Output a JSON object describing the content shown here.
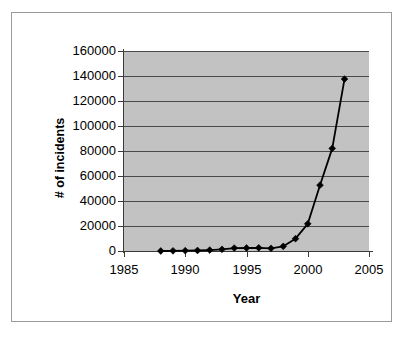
{
  "chart_data": {
    "type": "line",
    "title": "",
    "xlabel": "Year",
    "ylabel": "# of incidents",
    "xlim": [
      1985,
      2005
    ],
    "ylim": [
      0,
      160000
    ],
    "x_ticks": [
      1985,
      1990,
      1995,
      2000,
      2005
    ],
    "y_ticks": [
      0,
      20000,
      40000,
      60000,
      80000,
      100000,
      120000,
      140000,
      160000
    ],
    "x_tick_labels": [
      "1985",
      "1990",
      "1995",
      "2000",
      "2005"
    ],
    "y_tick_labels": [
      "0",
      "20000",
      "40000",
      "60000",
      "80000",
      "100000",
      "120000",
      "140000",
      "160000"
    ],
    "grid": "horizontal",
    "legend": "none",
    "marker": "diamond",
    "line_color": "#000000",
    "marker_color": "#000000",
    "plot_background": "#c2c2c2",
    "chart_background": "#ffffff",
    "x": [
      1988,
      1989,
      1990,
      1991,
      1992,
      1993,
      1994,
      1995,
      1996,
      1997,
      1998,
      1999,
      2000,
      2001,
      2002,
      2003
    ],
    "values": [
      6,
      132,
      252,
      406,
      773,
      1334,
      2340,
      2412,
      2573,
      2134,
      3734,
      9859,
      21756,
      52658,
      82094,
      137529
    ],
    "series": [
      {
        "name": "# of incidents",
        "values": [
          6,
          132,
          252,
          406,
          773,
          1334,
          2340,
          2412,
          2573,
          2134,
          3734,
          9859,
          21756,
          52658,
          82094,
          137529
        ]
      }
    ]
  },
  "axes": {
    "y_title": "# of incidents",
    "x_title": "Year"
  }
}
